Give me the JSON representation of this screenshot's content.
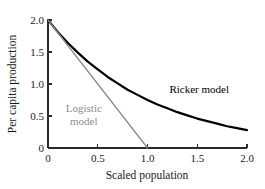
{
  "chart_data": {
    "type": "line",
    "title": "",
    "xlabel": "Scaled population",
    "ylabel": "Per capita production",
    "xlim": [
      0,
      2.0
    ],
    "ylim": [
      0,
      2.0
    ],
    "grid": false,
    "legend_position": "inline-annotation",
    "xticks": [
      0,
      0.5,
      1.0,
      1.5,
      2.0
    ],
    "xtick_labels": [
      "0",
      "0.5",
      "1.0",
      "1.5",
      "2.0"
    ],
    "yticks": [
      0,
      0.5,
      1.0,
      1.5,
      2.0
    ],
    "ytick_labels": [
      "0",
      "0.5",
      "1.0",
      "1.5",
      "2.0"
    ],
    "series": [
      {
        "name": "Ricker model",
        "color": "#000000",
        "width": 2.2,
        "x": [
          0,
          0.1,
          0.2,
          0.3,
          0.4,
          0.5,
          0.6,
          0.7,
          0.8,
          0.9,
          1.0,
          1.1,
          1.2,
          1.3,
          1.4,
          1.5,
          1.6,
          1.7,
          1.8,
          1.9,
          2.0
        ],
        "values": [
          2.0,
          1.81,
          1.64,
          1.49,
          1.35,
          1.23,
          1.11,
          1.01,
          0.91,
          0.83,
          0.75,
          0.68,
          0.62,
          0.56,
          0.51,
          0.46,
          0.42,
          0.38,
          0.34,
          0.31,
          0.28
        ]
      },
      {
        "name": "Logistic model",
        "color": "#8c8c8c",
        "width": 1.3,
        "x": [
          0,
          1.0
        ],
        "values": [
          2.0,
          0
        ]
      }
    ],
    "annotations": [
      {
        "text": "Ricker model",
        "x": 1.22,
        "y": 0.86,
        "color": "#000000",
        "lines": [
          "Ricker model"
        ]
      },
      {
        "text": "Logistic model",
        "x": 0.36,
        "y": 0.56,
        "color": "#8c8c8c",
        "lines": [
          "Logistic",
          "model"
        ]
      }
    ]
  }
}
